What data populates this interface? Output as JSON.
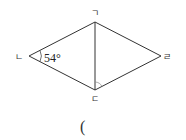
{
  "diagram": {
    "type": "rhombus-with-diagonal",
    "vertices": [
      {
        "id": "top",
        "label": "ㄱ",
        "x": 95,
        "y": 22
      },
      {
        "id": "left",
        "label": "ㄴ",
        "x": 29,
        "y": 56
      },
      {
        "id": "bottom",
        "label": "ㄷ",
        "x": 95,
        "y": 90
      },
      {
        "id": "right",
        "label": "ㄹ",
        "x": 161,
        "y": 56
      }
    ],
    "edges": [
      [
        "top",
        "left"
      ],
      [
        "left",
        "bottom"
      ],
      [
        "bottom",
        "right"
      ],
      [
        "right",
        "top"
      ],
      [
        "top",
        "bottom"
      ]
    ],
    "angle_label": "54°",
    "angle_at": "ㄴ",
    "marked_angle_at": "ㄷ",
    "stroke_color": "#333333"
  },
  "answer": {
    "open_paren": "("
  }
}
